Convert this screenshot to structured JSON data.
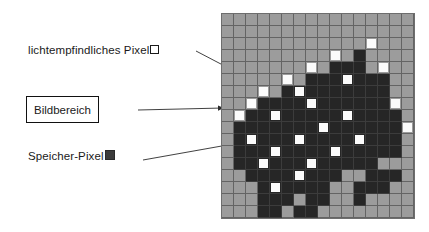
{
  "diagram": {
    "title_text": "",
    "labels": {
      "light_pixel": "lichtempfindliches Pixel",
      "image_area": "Bildbereich",
      "memory_pixel": "Speicher-Pixel"
    },
    "legend_markers": {
      "light_pixel_marker": "open-square-white",
      "memory_pixel_marker": "filled-square-dark"
    },
    "colors": {
      "background_cell": "#9c9c9c",
      "memory_cell": "#262626",
      "light_cell": "#fbfbfb",
      "grid_line": "#646464",
      "text": "#1a1a1a",
      "box_border": "#111111",
      "arrow": "#2b2b2b",
      "page": "#ffffff"
    },
    "grid": {
      "columns": 16,
      "rows": 17,
      "cell_size_px": 12,
      "origin_x_px": 222,
      "origin_y_px": 14,
      "legend": {
        "0": "background (inactive / outside image area)",
        "1": "memory pixel (dark)",
        "2": "light-sensitive pixel (white) on dark memory field",
        "3": "light-sensitive pixel (white) on background field"
      },
      "map": [
        [
          0,
          0,
          0,
          0,
          0,
          0,
          0,
          0,
          0,
          0,
          0,
          0,
          0,
          0,
          0,
          0
        ],
        [
          0,
          0,
          0,
          0,
          0,
          0,
          0,
          0,
          0,
          0,
          0,
          0,
          0,
          0,
          0,
          0
        ],
        [
          0,
          0,
          0,
          0,
          0,
          0,
          0,
          0,
          0,
          0,
          0,
          0,
          3,
          0,
          0,
          0
        ],
        [
          0,
          0,
          0,
          0,
          0,
          0,
          0,
          0,
          0,
          3,
          0,
          1,
          0,
          0,
          0,
          0
        ],
        [
          0,
          0,
          0,
          0,
          0,
          0,
          0,
          3,
          0,
          1,
          1,
          1,
          0,
          3,
          0,
          0
        ],
        [
          0,
          0,
          0,
          0,
          0,
          3,
          0,
          1,
          1,
          1,
          2,
          1,
          1,
          1,
          0,
          0
        ],
        [
          0,
          0,
          0,
          3,
          0,
          1,
          2,
          1,
          1,
          1,
          1,
          1,
          1,
          1,
          0,
          0
        ],
        [
          0,
          0,
          3,
          1,
          1,
          1,
          1,
          2,
          1,
          1,
          1,
          1,
          1,
          1,
          3,
          0
        ],
        [
          0,
          3,
          1,
          1,
          2,
          1,
          1,
          1,
          1,
          1,
          2,
          1,
          1,
          1,
          1,
          0
        ],
        [
          0,
          1,
          1,
          1,
          1,
          1,
          1,
          1,
          2,
          1,
          1,
          1,
          1,
          1,
          1,
          3
        ],
        [
          0,
          1,
          2,
          1,
          1,
          1,
          2,
          1,
          1,
          1,
          1,
          2,
          1,
          1,
          1,
          0
        ],
        [
          0,
          1,
          1,
          1,
          2,
          1,
          1,
          1,
          1,
          2,
          1,
          1,
          1,
          1,
          1,
          0
        ],
        [
          0,
          1,
          1,
          2,
          1,
          1,
          1,
          2,
          1,
          1,
          1,
          1,
          1,
          0,
          0,
          0
        ],
        [
          0,
          0,
          1,
          1,
          1,
          1,
          2,
          1,
          1,
          1,
          0,
          0,
          1,
          1,
          1,
          0
        ],
        [
          0,
          0,
          0,
          1,
          2,
          1,
          1,
          1,
          1,
          0,
          0,
          1,
          1,
          1,
          0,
          0
        ],
        [
          0,
          0,
          0,
          1,
          1,
          1,
          0,
          1,
          1,
          0,
          0,
          1,
          0,
          0,
          0,
          0
        ],
        [
          0,
          0,
          0,
          1,
          1,
          0,
          1,
          1,
          0,
          0,
          0,
          0,
          0,
          0,
          0,
          0
        ]
      ]
    },
    "connectors": [
      {
        "name": "light-pixel-connector",
        "from_label": "lichtempfindliches Pixel",
        "points": "198,52 240,74",
        "arrow_at": "240,74"
      },
      {
        "name": "image-area-connector",
        "from_label": "Bildbereich",
        "points": "138,110 222,108",
        "arrow_at": "222,108"
      },
      {
        "name": "memory-pixel-connector",
        "from_label": "Speicher-Pixel",
        "points": "144,160 232,144",
        "arrow_at": "232,144"
      }
    ]
  }
}
